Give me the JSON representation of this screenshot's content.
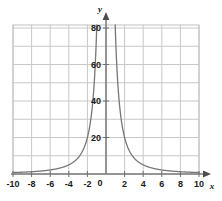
{
  "figure": {
    "background_color": "#ffffff",
    "axis_label_x": "x",
    "axis_label_y": "y",
    "origin_label": "0"
  },
  "colors": {
    "grid": "#c8c8c8",
    "axis": "#808080",
    "curve": "#777777",
    "text": "#1a1a1a",
    "plot_border": "#b4b4b4"
  },
  "chart_data": {
    "type": "line",
    "title": "",
    "xlabel": "x",
    "ylabel": "y",
    "xlim": [
      -10,
      10
    ],
    "ylim": [
      0,
      85
    ],
    "grid": true,
    "grid_x_step": 2,
    "grid_y_step": 10,
    "legend": "none",
    "x_tick_labels": [
      "-10",
      "-8",
      "-6",
      "-4",
      "-2",
      "0",
      "2",
      "4",
      "6",
      "8",
      "10"
    ],
    "x_tick_values": [
      -10,
      -8,
      -6,
      -4,
      -2,
      0,
      2,
      4,
      6,
      8,
      10
    ],
    "y_tick_labels": [
      "20",
      "40",
      "60",
      "80"
    ],
    "y_tick_values": [
      20,
      40,
      60,
      80
    ],
    "annotations": [],
    "series": [
      {
        "name": "y = 80/x^2",
        "expression": "80/x^2",
        "asymptote_vertical": 0,
        "asymptote_horizontal": 0,
        "branch_left": {
          "x": [
            -10,
            -9,
            -8,
            -7,
            -6,
            -5,
            -4.5,
            -4,
            -3.5,
            -3,
            -2.75,
            -2.5,
            -2.25,
            -2,
            -1.9,
            -1.8,
            -1.7,
            -1.6,
            -1.5,
            -1.4,
            -1.3,
            -1.2,
            -1.1,
            -1.05,
            -1.0
          ],
          "y": [
            0.8,
            0.99,
            1.25,
            1.63,
            2.22,
            3.2,
            3.95,
            5.0,
            6.53,
            8.89,
            10.58,
            12.8,
            15.8,
            20.0,
            22.16,
            24.69,
            27.68,
            31.25,
            35.56,
            40.82,
            47.34,
            55.56,
            66.12,
            72.56,
            80.0
          ]
        },
        "branch_right": {
          "x": [
            1.0,
            1.05,
            1.1,
            1.2,
            1.3,
            1.4,
            1.5,
            1.6,
            1.7,
            1.8,
            1.9,
            2.0,
            2.25,
            2.5,
            2.75,
            3,
            3.5,
            4,
            4.5,
            5,
            6,
            7,
            8,
            9,
            10
          ],
          "y": [
            80.0,
            72.56,
            66.12,
            55.56,
            47.34,
            40.82,
            35.56,
            31.25,
            27.68,
            24.69,
            22.16,
            20.0,
            15.8,
            12.8,
            10.58,
            8.89,
            6.53,
            5.0,
            3.95,
            3.2,
            2.22,
            1.63,
            1.25,
            0.99,
            0.8
          ]
        }
      }
    ]
  }
}
